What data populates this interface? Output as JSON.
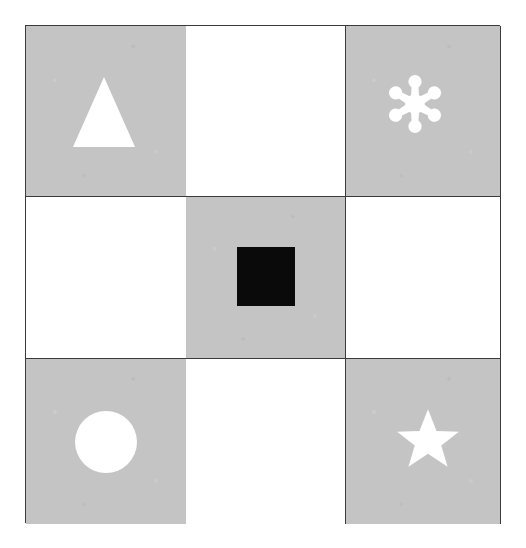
{
  "figure": {
    "type": "shape-grid",
    "rows": 3,
    "columns": 3,
    "background_color": "#ffffff",
    "gray_cell_color": "#c4c4c4",
    "white_cell_color": "#ffffff",
    "grid_line_color": "#3b3b3b",
    "shape_fill_white": "#ffffff",
    "shape_fill_black": "#000000",
    "pattern": "checkerboard",
    "grid_bounds": {
      "left": 25,
      "top": 25,
      "width": 475,
      "height": 498
    }
  },
  "cells": [
    {
      "row": 0,
      "column": 0,
      "index": 0,
      "background": "gray",
      "shape": "triangle",
      "shape_name": "triangle-shape",
      "shape_color": "#ffffff",
      "has_shape": true
    },
    {
      "row": 0,
      "column": 1,
      "index": 1,
      "background": "white",
      "shape": "none",
      "shape_name": "empty-cell",
      "shape_color": "",
      "has_shape": false
    },
    {
      "row": 0,
      "column": 2,
      "index": 2,
      "background": "gray",
      "shape": "asterisk",
      "shape_name": "asterisk-flower-shape",
      "shape_color": "#ffffff",
      "has_shape": true,
      "petals": 6
    },
    {
      "row": 1,
      "column": 0,
      "index": 3,
      "background": "white",
      "shape": "none",
      "shape_name": "empty-cell",
      "shape_color": "",
      "has_shape": false
    },
    {
      "row": 1,
      "column": 1,
      "index": 4,
      "background": "gray",
      "shape": "square",
      "shape_name": "square-shape",
      "shape_color": "#000000",
      "has_shape": true
    },
    {
      "row": 1,
      "column": 2,
      "index": 5,
      "background": "white",
      "shape": "none",
      "shape_name": "empty-cell",
      "shape_color": "",
      "has_shape": false
    },
    {
      "row": 2,
      "column": 0,
      "index": 6,
      "background": "gray",
      "shape": "circle",
      "shape_name": "circle-shape",
      "shape_color": "#ffffff",
      "has_shape": true
    },
    {
      "row": 2,
      "column": 1,
      "index": 7,
      "background": "white",
      "shape": "none",
      "shape_name": "empty-cell",
      "shape_color": "",
      "has_shape": false
    },
    {
      "row": 2,
      "column": 2,
      "index": 8,
      "background": "gray",
      "shape": "star",
      "shape_name": "star-shape",
      "shape_color": "#ffffff",
      "has_shape": true,
      "points": 5
    }
  ]
}
